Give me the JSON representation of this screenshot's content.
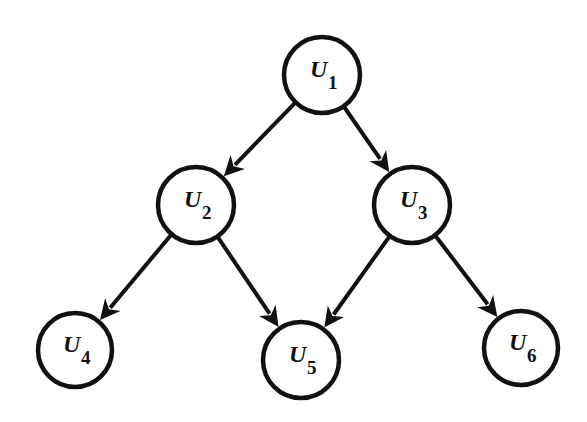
{
  "diagram": {
    "type": "directed-graph",
    "nodes": [
      {
        "id": "U1",
        "letter": "U",
        "sub": "1",
        "cx": 322,
        "cy": 75,
        "r": 38
      },
      {
        "id": "U2",
        "letter": "U",
        "sub": "2",
        "cx": 196,
        "cy": 205,
        "r": 38
      },
      {
        "id": "U3",
        "letter": "U",
        "sub": "3",
        "cx": 412,
        "cy": 205,
        "r": 38
      },
      {
        "id": "U4",
        "letter": "U",
        "sub": "4",
        "cx": 75,
        "cy": 350,
        "r": 37
      },
      {
        "id": "U5",
        "letter": "U",
        "sub": "5",
        "cx": 301,
        "cy": 360,
        "r": 38
      },
      {
        "id": "U6",
        "letter": "U",
        "sub": "6",
        "cx": 521,
        "cy": 348,
        "r": 37
      }
    ],
    "edges": [
      {
        "from": "U1",
        "to": "U2"
      },
      {
        "from": "U1",
        "to": "U3"
      },
      {
        "from": "U2",
        "to": "U4"
      },
      {
        "from": "U2",
        "to": "U5"
      },
      {
        "from": "U3",
        "to": "U5"
      },
      {
        "from": "U3",
        "to": "U6"
      }
    ]
  }
}
